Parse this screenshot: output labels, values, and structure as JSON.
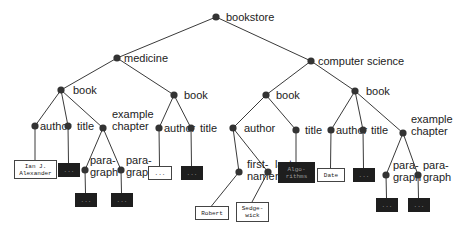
{
  "diagram": {
    "type": "xml-tree",
    "root": "bookstore",
    "nodes": [
      {
        "id": "bookstore",
        "label": "bookstore",
        "x": 216,
        "y": 17,
        "lx": 226,
        "ly": 21
      },
      {
        "id": "medicine",
        "label": "medicine",
        "x": 117,
        "y": 58,
        "lx": 124,
        "ly": 62
      },
      {
        "id": "cs",
        "label": "computer science",
        "x": 311,
        "y": 61,
        "lx": 318,
        "ly": 65
      },
      {
        "id": "book1",
        "label": "book",
        "x": 61,
        "y": 90,
        "lx": 73,
        "ly": 94
      },
      {
        "id": "book2",
        "label": "book",
        "x": 174,
        "y": 95,
        "lx": 184,
        "ly": 99
      },
      {
        "id": "book3",
        "label": "book",
        "x": 266,
        "y": 95,
        "lx": 276,
        "ly": 99
      },
      {
        "id": "book4",
        "label": "book",
        "x": 355,
        "y": 91,
        "lx": 366,
        "ly": 95
      },
      {
        "id": "author1",
        "label": "author",
        "x": 35,
        "y": 126,
        "lx": 40,
        "ly": 130
      },
      {
        "id": "title1",
        "label": "title",
        "x": 68,
        "y": 126,
        "lx": 77,
        "ly": 130
      },
      {
        "id": "chap1",
        "label": "example|chapter",
        "x": 103,
        "y": 128,
        "lx": 112,
        "ly": 118
      },
      {
        "id": "para1",
        "label": "para-|graph",
        "x": 85,
        "y": 170,
        "lx": 90,
        "ly": 164
      },
      {
        "id": "para2",
        "label": "para-|graph",
        "x": 121,
        "y": 170,
        "lx": 126,
        "ly": 164
      },
      {
        "id": "author2",
        "label": "author",
        "x": 159,
        "y": 128,
        "lx": 164,
        "ly": 132
      },
      {
        "id": "title2",
        "label": "title",
        "x": 191,
        "y": 128,
        "lx": 200,
        "ly": 132
      },
      {
        "id": "author3",
        "label": "author",
        "x": 233,
        "y": 128,
        "lx": 244,
        "ly": 132
      },
      {
        "id": "title3",
        "label": "title",
        "x": 296,
        "y": 130,
        "lx": 305,
        "ly": 134
      },
      {
        "id": "first",
        "label": "first-|name",
        "x": 239,
        "y": 172,
        "lx": 247,
        "ly": 168
      },
      {
        "id": "last",
        "label": "last-|name",
        "x": 268,
        "y": 172,
        "lx": 275,
        "ly": 168
      },
      {
        "id": "author4",
        "label": "author",
        "x": 331,
        "y": 130,
        "lx": 336,
        "ly": 134
      },
      {
        "id": "title4",
        "label": "title",
        "x": 363,
        "y": 130,
        "lx": 371,
        "ly": 134
      },
      {
        "id": "chap2",
        "label": "example|chapter",
        "x": 403,
        "y": 133,
        "lx": 411,
        "ly": 123
      },
      {
        "id": "para3",
        "label": "para-|graph",
        "x": 386,
        "y": 175,
        "lx": 393,
        "ly": 169
      },
      {
        "id": "para4",
        "label": "para-|graph",
        "x": 418,
        "y": 175,
        "lx": 423,
        "ly": 169
      }
    ],
    "edges": [
      [
        "bookstore",
        "medicine"
      ],
      [
        "bookstore",
        "cs"
      ],
      [
        "medicine",
        "book1"
      ],
      [
        "medicine",
        "book2"
      ],
      [
        "cs",
        "book3"
      ],
      [
        "cs",
        "book4"
      ],
      [
        "book1",
        "author1"
      ],
      [
        "book1",
        "title1"
      ],
      [
        "book1",
        "chap1"
      ],
      [
        "chap1",
        "para1"
      ],
      [
        "chap1",
        "para2"
      ],
      [
        "book2",
        "author2"
      ],
      [
        "book2",
        "title2"
      ],
      [
        "book3",
        "author3"
      ],
      [
        "book3",
        "title3"
      ],
      [
        "author3",
        "first"
      ],
      [
        "author3",
        "last"
      ],
      [
        "book4",
        "author4"
      ],
      [
        "book4",
        "title4"
      ],
      [
        "book4",
        "chap2"
      ],
      [
        "chap2",
        "para3"
      ],
      [
        "chap2",
        "para4"
      ]
    ],
    "leaves": [
      {
        "parent": "author1",
        "text": "Ian J.|Alexander",
        "x": 14,
        "y": 160,
        "w": 42,
        "h": 18,
        "dark": false
      },
      {
        "parent": "title1",
        "text": "...",
        "x": 58,
        "y": 163,
        "w": 21,
        "h": 13,
        "dark": true
      },
      {
        "parent": "para1",
        "text": "...",
        "x": 75,
        "y": 193,
        "w": 21,
        "h": 13,
        "dark": true
      },
      {
        "parent": "para2",
        "text": "...",
        "x": 111,
        "y": 193,
        "w": 21,
        "h": 13,
        "dark": true
      },
      {
        "parent": "author2",
        "text": "...",
        "x": 148,
        "y": 166,
        "w": 23,
        "h": 13,
        "dark": false
      },
      {
        "parent": "title2",
        "text": "...",
        "x": 181,
        "y": 166,
        "w": 21,
        "h": 13,
        "dark": true
      },
      {
        "parent": "first",
        "text": "Robert",
        "x": 195,
        "y": 206,
        "w": 33,
        "h": 13,
        "dark": false
      },
      {
        "parent": "last",
        "text": "Sedge-|wick",
        "x": 236,
        "y": 202,
        "w": 32,
        "h": 19,
        "dark": false
      },
      {
        "parent": "title3",
        "text": "Algo-|rithms",
        "x": 278,
        "y": 162,
        "w": 36,
        "h": 20,
        "dark": true
      },
      {
        "parent": "author4",
        "text": "Date",
        "x": 317,
        "y": 168,
        "w": 27,
        "h": 13,
        "dark": false
      },
      {
        "parent": "title4",
        "text": "...",
        "x": 353,
        "y": 168,
        "w": 21,
        "h": 13,
        "dark": true
      },
      {
        "parent": "para3",
        "text": "...",
        "x": 376,
        "y": 198,
        "w": 21,
        "h": 13,
        "dark": true
      },
      {
        "parent": "para4",
        "text": "...",
        "x": 408,
        "y": 198,
        "w": 21,
        "h": 13,
        "dark": true
      }
    ],
    "colors": {
      "line": "#3a3a3a",
      "node": "#333333",
      "dark_box": "#1e1e1e",
      "light_box_border": "#444444"
    }
  }
}
